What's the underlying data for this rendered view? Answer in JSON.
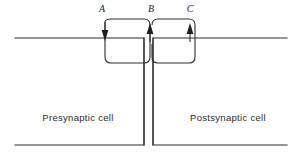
{
  "figure": {
    "background_color": "#ffffff",
    "line_color": "#2f2f2f",
    "arrow_color": "#1f1f1f",
    "text_color": "#2b2b2b"
  },
  "labels": {
    "a": "A",
    "b": "B",
    "c": "C"
  },
  "cells": {
    "presynaptic": "Presynaptic cell",
    "postsynaptic": "Postsynaptic cell"
  },
  "diagram_data": {
    "type": "schematic",
    "description": "Cross-section of a chemical synapse showing presynaptic cell on the left and postsynaptic cell on the right separated by a narrow vertical synaptic cleft. Three labeled arrows A, B and C mark membrane sites; A points downward into the presynaptic membrane, B points upward at the cleft, C points upward into the postsynaptic membrane. Rounded rectangular loop paths connect A to B and B to C.",
    "arrows": [
      {
        "label": "A",
        "x": 105,
        "direction": "down",
        "tip_y": 40,
        "tail_y": 22
      },
      {
        "label": "B",
        "x": 150,
        "direction": "up",
        "tip_y": 24,
        "tail_y": 42
      },
      {
        "label": "C",
        "x": 190,
        "direction": "up",
        "tip_y": 24,
        "tail_y": 42
      }
    ],
    "loops": [
      {
        "name": "left-loop",
        "from": "A",
        "to": "B",
        "top_y": 19,
        "bottom_y": 63,
        "left_x": 100,
        "right_x": 150
      },
      {
        "name": "right-loop",
        "from": "B",
        "to": "C",
        "top_y": 19,
        "bottom_y": 63,
        "left_x": 152,
        "right_x": 195
      }
    ],
    "membranes": {
      "top_y": 38,
      "bottom_y": 145,
      "left_extent": [
        15,
        144
      ],
      "right_extent": [
        153,
        287
      ],
      "cleft_left_x": 144,
      "cleft_right_x": 153
    }
  }
}
